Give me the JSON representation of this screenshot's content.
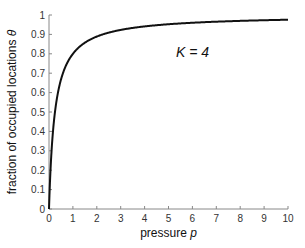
{
  "chart_data": {
    "type": "line",
    "title": "",
    "xlabel": "pressure",
    "xlabel_var": "p",
    "ylabel": "fraction of occupied locations",
    "ylabel_var": "θ",
    "xlim": [
      0,
      10
    ],
    "ylim": [
      0,
      1
    ],
    "xticks": [
      "0",
      "1",
      "2",
      "3",
      "4",
      "5",
      "6",
      "7",
      "8",
      "9",
      "10"
    ],
    "yticks": [
      "0",
      "0.1",
      "0.2",
      "0.3",
      "0.4",
      "0.5",
      "0.6",
      "0.7",
      "0.8",
      "0.9",
      "1"
    ],
    "grid": false,
    "legend": null,
    "annotations": [
      {
        "text": "K = 4",
        "x": 6,
        "y": 0.8
      }
    ],
    "series": [
      {
        "name": "θ = Kp / (1 + Kp)",
        "K": 4,
        "color": "#111111",
        "x": [
          0,
          0.05,
          0.1,
          0.2,
          0.3,
          0.5,
          0.75,
          1,
          1.5,
          2,
          3,
          4,
          5,
          6,
          7,
          8,
          9,
          10
        ],
        "y": [
          0,
          0.167,
          0.286,
          0.444,
          0.545,
          0.667,
          0.75,
          0.8,
          0.857,
          0.889,
          0.923,
          0.941,
          0.952,
          0.96,
          0.966,
          0.97,
          0.973,
          0.976
        ]
      }
    ]
  }
}
